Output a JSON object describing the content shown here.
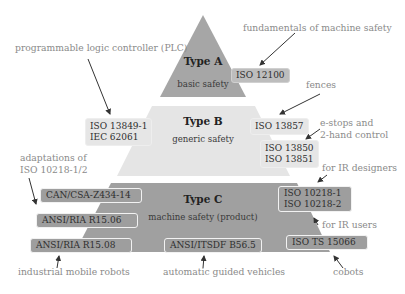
{
  "diagram": {
    "colors": {
      "type_a": "#a6a6a6",
      "type_b": "#e5e5e5",
      "type_c": "#a0a0a0",
      "box_light": "#e6e6e6",
      "box_dark": "#9e9e9e",
      "annotation_text": "#8a8a8a",
      "arrow": "#333333"
    },
    "tiers": [
      {
        "title": "Type A",
        "subtitle": "basic safety"
      },
      {
        "title": "Type B",
        "subtitle": "generic safety"
      },
      {
        "title": "Type C",
        "subtitle": "machine safety (product)"
      }
    ],
    "standards": {
      "iso_12100": "ISO 12100",
      "iso_13849_line1": "ISO 13849-1",
      "iec_62061_line2": "IEC 62061",
      "iso_13857": "ISO 13857",
      "iso_13850": "ISO 13850",
      "iso_13851": "ISO 13851",
      "can_csa": "CAN/CSA-Z434-14",
      "ansi_ria_15_06": "ANSI/RIA R15.06",
      "ansi_ria_15_08": "ANSI/RIA R15.08",
      "ansi_itsdf": "ANSI/ITSDF B56.5",
      "iso_10218_1": "ISO 10218-1",
      "iso_10218_2": "ISO 10218-2",
      "iso_ts_15066": "ISO TS 15066"
    },
    "annotations": {
      "fundamentals": "fundamentals of machine safety",
      "plc": "programmable logic controller (PLC)",
      "fences": "fences",
      "estops_line1": "e-stops and",
      "estops_line2": "2-hand control",
      "adaptations_line1": "adaptations of",
      "adaptations_line2": "ISO 10218-1/2",
      "ir_designers": "for IR designers",
      "ir_users": "for IR users",
      "industrial_mobile_robots": "industrial mobile robots",
      "agv": "automatic guided vehicles",
      "cobots": "cobots"
    }
  }
}
